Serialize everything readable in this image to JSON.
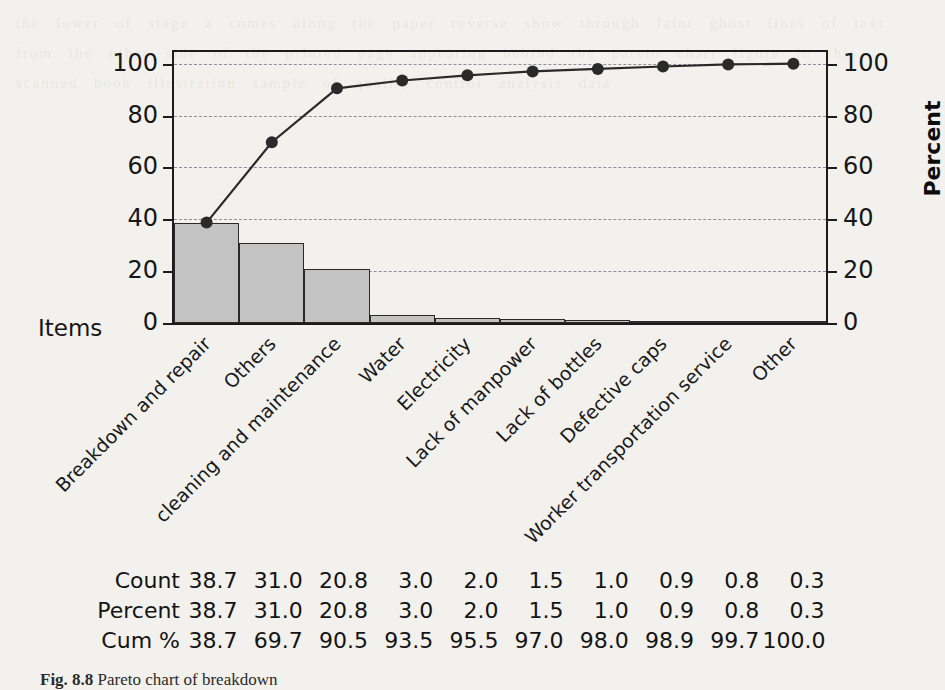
{
  "figure": {
    "caption_prefix": "Fig. 8.8",
    "caption_text": "Pareto chart of breakdown"
  },
  "axes": {
    "x_axis_title": "Items",
    "y_axis_right_title": "Percent",
    "y_ticks_left": [
      "0",
      "20",
      "40",
      "60",
      "80",
      "100"
    ],
    "y_ticks_right": [
      "0",
      "20",
      "40",
      "60",
      "80",
      "100"
    ]
  },
  "table": {
    "row_labels": [
      "Count",
      "Percent",
      "Cum %"
    ],
    "rows": [
      [
        "38.7",
        "31.0",
        "20.8",
        "3.0",
        "2.0",
        "1.5",
        "1.0",
        "0.9",
        "0.8",
        "0.3"
      ],
      [
        "38.7",
        "31.0",
        "20.8",
        "3.0",
        "2.0",
        "1.5",
        "1.0",
        "0.9",
        "0.8",
        "0.3"
      ],
      [
        "38.7",
        "69.7",
        "90.5",
        "93.5",
        "95.5",
        "97.0",
        "98.0",
        "98.9",
        "99.7",
        "100.0"
      ]
    ]
  },
  "chart_data": {
    "type": "bar",
    "title": "",
    "subtitle": "",
    "xlabel": "Items",
    "ylabel": "",
    "ylabel_right": "Percent",
    "ylim": [
      0,
      104.5
    ],
    "ylim_right": [
      0,
      104.5
    ],
    "grid": true,
    "legend": "none",
    "categories": [
      "Breakdown and repair",
      "Others",
      "cleaning and maintenance",
      "Water",
      "Electricity",
      "Lack of manpower",
      "Lack of bottles",
      "Defective caps",
      "Worker transportation service",
      "Other"
    ],
    "series": [
      {
        "name": "Count",
        "kind": "bar",
        "values": [
          38.7,
          31.0,
          20.8,
          3.0,
          2.0,
          1.5,
          1.0,
          0.9,
          0.8,
          0.3
        ],
        "color": "#c3c3c3"
      },
      {
        "name": "Cum %",
        "kind": "line",
        "values": [
          38.7,
          69.7,
          90.5,
          93.5,
          95.5,
          97.0,
          98.0,
          98.9,
          99.7,
          100.0
        ],
        "color": "#2a2a2a"
      }
    ],
    "yticks": [
      0,
      20,
      40,
      60,
      80,
      100
    ],
    "yticks_right": [
      0,
      20,
      40,
      60,
      80,
      100
    ]
  },
  "colors": {
    "bar_fill": "#c3c3c3",
    "bar_stroke": "#2a2a2a",
    "line": "#2a2a2a",
    "grid": "#8d8f9a",
    "axis": "#1c1c1c",
    "page": "#f3f1ed"
  },
  "bleed_text": "the lower of stage a comes along the paper reverse show through faint ghost lines of text from the other side of the printed page appearing behind the pareto chart figure in this scanned book illustration sample of quality control analysis data"
}
